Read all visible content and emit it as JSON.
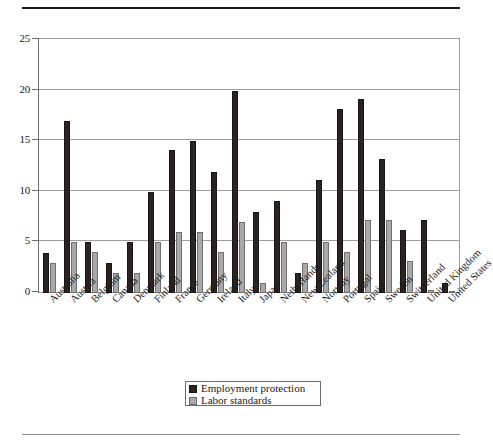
{
  "chart_data": {
    "type": "bar",
    "title": "",
    "xlabel": "",
    "ylabel": "",
    "ylim": [
      0,
      25
    ],
    "yticks": [
      0,
      5,
      10,
      15,
      20,
      25
    ],
    "grid": true,
    "legend_position": "bottom-center",
    "categories": [
      "Australia",
      "Austria",
      "Belgium",
      "Canada",
      "Denmark",
      "Finland",
      "France",
      "Germany",
      "Ireland",
      "Italy",
      "Japan",
      "Netherlands",
      "New Zealand",
      "Norway",
      "Portugal",
      "Spain",
      "Sweden",
      "Switzerland",
      "United Kingdom",
      "United States"
    ],
    "series": [
      {
        "name": "Employment protection",
        "color": "#2b2320",
        "values": [
          4,
          17,
          5,
          3,
          5,
          10,
          14.1,
          15,
          12,
          20,
          8,
          9.1,
          2,
          11.2,
          18.2,
          19.2,
          13.2,
          6.2,
          7.2,
          1
        ]
      },
      {
        "name": "Labor standards",
        "color": "#a9a9a9",
        "values": [
          3,
          5,
          4.1,
          2,
          2,
          5,
          6,
          6,
          4.1,
          7,
          1,
          5,
          3,
          5,
          4.1,
          7.2,
          7.2,
          3.2,
          0.3,
          0.2
        ]
      }
    ]
  },
  "legend": {
    "items": [
      {
        "label": "Employment protection",
        "swatch": "dark"
      },
      {
        "label": "Labor standards",
        "swatch": "light"
      }
    ]
  },
  "axis": {
    "y_tick_labels": [
      "25",
      "20",
      "15",
      "10",
      "5",
      "0"
    ]
  }
}
